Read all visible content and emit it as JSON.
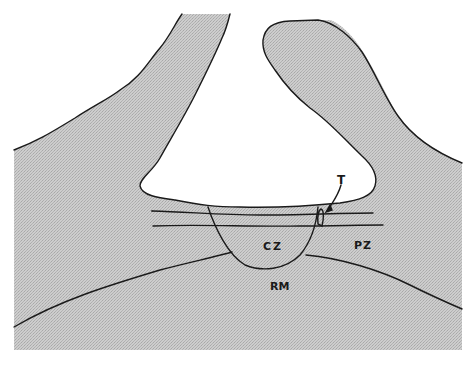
{
  "figure": {
    "type": "anatomical-diagram",
    "colors": {
      "background": "#ffffff",
      "tissue_fill": "#c4c4c4",
      "outline": "#1a1a1a"
    },
    "labels": {
      "t": "T",
      "cz": "CZ",
      "pz": "PZ",
      "rm": "RM"
    }
  }
}
